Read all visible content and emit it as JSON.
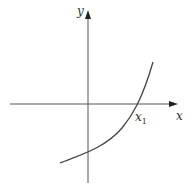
{
  "figure": {
    "type": "function-graph",
    "axes": {
      "x_label": "x",
      "y_label": "y",
      "x_axis": {
        "x1": 10,
        "x2": 178,
        "y": 104
      },
      "y_axis": {
        "x": 88,
        "y1": 183,
        "y2": 10
      }
    },
    "curve": {
      "description": "increasing concave-up curve crossing the x-axis at x1",
      "x_intercept_label": "x",
      "x_intercept_subscript": "1"
    },
    "colors": {
      "axis": "#555555",
      "curve": "#444444",
      "background": "#ffffff"
    }
  }
}
